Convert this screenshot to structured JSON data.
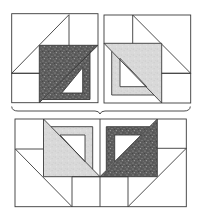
{
  "figure": {
    "colors": {
      "dark_fabric": "#5c5c5c",
      "light_fabric": "#d9d9d9",
      "outline": "#3a3a3a",
      "background": "#ffffff"
    },
    "top_left_block": {
      "name": "dark-fabric-block",
      "fabric": "dark",
      "outer": [
        11.7,
        13.7,
        98,
        102.7
      ]
    },
    "top_right_block": {
      "name": "light-fabric-block",
      "fabric": "light",
      "outer": [
        104,
        15,
        190.7,
        103
      ]
    },
    "brace": {
      "from_x": 11.7,
      "to_x": 190,
      "center_x": 100,
      "y": 111,
      "tip_y": 114
    },
    "bottom_block": {
      "name": "combined-block",
      "outer": [
        15,
        119,
        186.3,
        206.7
      ],
      "center_seam_x": 100
    }
  }
}
